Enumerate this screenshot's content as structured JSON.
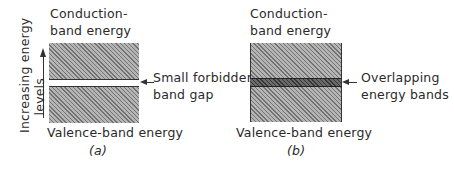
{
  "figure_a": {
    "conduction_label_1": "Conduction-",
    "conduction_label_2": "band energy",
    "valence_label": "Valence-band energy",
    "axis_label_1": "Increasing energy",
    "axis_label_2": "levels",
    "gap_label_1": "Small forbidden-",
    "gap_label_2": "band gap",
    "caption": "(a)"
  },
  "figure_b": {
    "conduction_label_1": "Conduction-",
    "conduction_label_2": "band energy",
    "valence_label": "Valence-band energy",
    "overlap_label_1": "Overlapping",
    "overlap_label_2": "energy bands",
    "caption": "(b)"
  }
}
